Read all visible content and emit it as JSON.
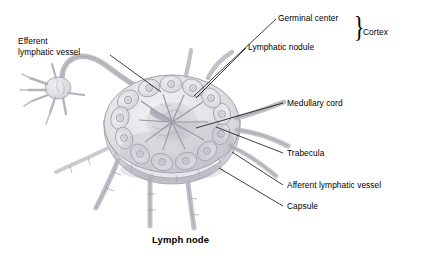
{
  "figure": {
    "caption": "Lymph node",
    "background_color": "#ffffff",
    "text_color": "#000000",
    "ink_color": "#9a9aa4"
  },
  "labels": {
    "germinal_center": "Germinal center",
    "lymphatic_nodule": "Lymphatic nodule",
    "cortex": "Cortex",
    "efferent_lymphatic_vessel": "Efferent\nlymphatic vessel",
    "medullary_cord": "Medullary cord",
    "trabecula": "Trabecula",
    "afferent_lymphatic_vessel": "Afferent lymphatic vessel",
    "capsule": "Capsule",
    "brace_glyph": "}"
  },
  "structures": [
    {
      "name": "germinal-center",
      "label": "Germinal center",
      "group": "Cortex"
    },
    {
      "name": "lymphatic-nodule",
      "label": "Lymphatic nodule",
      "group": "Cortex"
    },
    {
      "name": "medullary-cord",
      "label": "Medullary cord",
      "group": "Medulla"
    },
    {
      "name": "trabecula",
      "label": "Trabecula",
      "group": "Stroma"
    },
    {
      "name": "capsule",
      "label": "Capsule",
      "group": "Stroma"
    },
    {
      "name": "afferent-lymphatic-vessel",
      "label": "Afferent lymphatic vessel",
      "group": "Vessels"
    },
    {
      "name": "efferent-lymphatic-vessel",
      "label": "Efferent lymphatic vessel",
      "group": "Vessels"
    }
  ]
}
